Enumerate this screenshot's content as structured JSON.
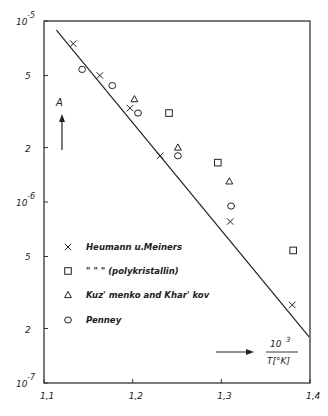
{
  "chart_data": {
    "type": "scatter",
    "title": "",
    "xlabel_num": "10",
    "xlabel_exp": "3",
    "xlabel_den": "T[°K]",
    "ylabel": "A",
    "yscale": "log",
    "xlim": [
      1.1,
      1.4
    ],
    "ylim": [
      1e-07,
      1e-05
    ],
    "grid": false,
    "legend_position": "lower-left inside",
    "x_ticks": [
      "1,1",
      "1,2",
      "1,3",
      "1,4"
    ],
    "y_ticks": [
      {
        "value": 1e-05,
        "label": "10",
        "exp": "-5"
      },
      {
        "value": 5e-06,
        "label": "5",
        "exp": ""
      },
      {
        "value": 2e-06,
        "label": "2",
        "exp": ""
      },
      {
        "value": 1e-06,
        "label": "10",
        "exp": "-6"
      },
      {
        "value": 5e-07,
        "label": "5",
        "exp": ""
      },
      {
        "value": 2e-07,
        "label": "2",
        "exp": ""
      },
      {
        "value": 1e-07,
        "label": "10",
        "exp": "-7"
      }
    ],
    "series": [
      {
        "name": "Heumann u. Meiners",
        "marker": "x",
        "x": [
          1.133,
          1.163,
          1.197,
          1.231,
          1.31,
          1.38
        ],
        "y": [
          7.5e-06,
          5e-06,
          3.3e-06,
          1.8e-06,
          7.8e-07,
          2.7e-07
        ]
      },
      {
        "name": "\"  \"  \" (polykristallin)",
        "marker": "square",
        "x": [
          1.241,
          1.296,
          1.381
        ],
        "y": [
          3.1e-06,
          1.65e-06,
          5.4e-07
        ]
      },
      {
        "name": "Kuz' menko and Khar' kov",
        "marker": "triangle",
        "x": [
          1.202,
          1.251,
          1.309
        ],
        "y": [
          3.7e-06,
          2e-06,
          1.3e-06
        ]
      },
      {
        "name": "Penney",
        "marker": "circle",
        "x": [
          1.143,
          1.177,
          1.206,
          1.251,
          1.311
        ],
        "y": [
          5.4e-06,
          4.4e-06,
          3.1e-06,
          1.8e-06,
          9.5e-07
        ]
      }
    ],
    "fit_line": {
      "x": [
        1.114,
        1.399
      ],
      "y": [
        8.9e-06,
        1.8e-07
      ]
    }
  },
  "legend": [
    {
      "symbol": "x",
      "label": "Heumann u.Meiners"
    },
    {
      "symbol": "square",
      "label": "\"   \"   \"   (polykristallin)"
    },
    {
      "symbol": "triangle",
      "label": "Kuz' menko and Khar' kov"
    },
    {
      "symbol": "circle",
      "label": "Penney"
    }
  ]
}
